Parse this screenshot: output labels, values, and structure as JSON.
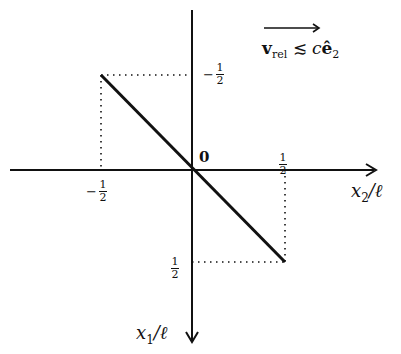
{
  "diagram": {
    "annotation": {
      "arrow_label": "v",
      "sub": "rel",
      "relation": "≲",
      "rhs_c": "c",
      "rhs_e": "ê",
      "rhs_sub": "2"
    },
    "axes": {
      "horizontal": {
        "label_var": "x",
        "label_sub": "2",
        "label_div": "/ℓ"
      },
      "vertical": {
        "label_var": "x",
        "label_sub": "1",
        "label_div": "/ℓ"
      }
    },
    "origin_label": "0",
    "ticks": {
      "h_neg": {
        "sign": "−",
        "num": "1",
        "den": "2"
      },
      "h_pos": {
        "sign": "",
        "num": "1",
        "den": "2"
      },
      "v_neg": {
        "sign": "−",
        "num": "1",
        "den": "2"
      },
      "v_pos": {
        "sign": "",
        "num": "1",
        "den": "2"
      }
    },
    "segment": {
      "from": [
        -0.5,
        -0.5
      ],
      "to": [
        0.5,
        0.5
      ],
      "description": "thick line from (x2=-1/2, x1=-1/2) to (x2=1/2, x1=1/2)"
    },
    "colors": {
      "ink": "#111111",
      "background": "#ffffff"
    }
  }
}
